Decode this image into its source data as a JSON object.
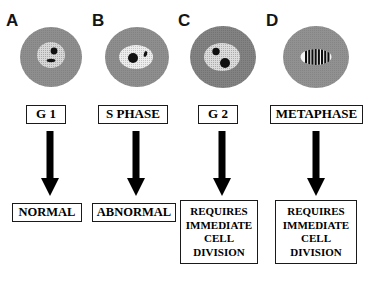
{
  "figure": {
    "background_color": "#ffffff",
    "ink_color": "#000000"
  },
  "colors": {
    "cytoplasm": "#8c8c8c",
    "cytoplasm_dark": "#7b7b7b",
    "nucleus_stipple_light": "#d8d8d8",
    "nucleus_white": "#f2f2f2",
    "chromatin": "#101010",
    "box_border": "#1a1a1a",
    "arrow": "#000000"
  },
  "columns": [
    {
      "letter": "A",
      "phase_label": "G 1",
      "outcome_lines": [
        "NORMAL"
      ],
      "cell": {
        "name": "cell-g1",
        "cytoplasm_fill": "#8c8c8c",
        "nucleus_fill": "#d8d8d8",
        "nucleus_style": "stippled",
        "bodies": [
          {
            "name": "chromatin-dot",
            "shape": "circle",
            "label": "round dark body"
          },
          {
            "name": "chromatin-dash",
            "shape": "ellipse",
            "label": "small dark dash"
          }
        ]
      }
    },
    {
      "letter": "B",
      "phase_label": "S PHASE",
      "outcome_lines": [
        "ABNORMAL"
      ],
      "cell": {
        "name": "cell-s-phase",
        "cytoplasm_fill": "#8c8c8c",
        "nucleus_fill": "#f2f2f2",
        "nucleus_style": "stippled-pale",
        "bodies": [
          {
            "name": "chromatin-dot-large",
            "shape": "circle",
            "label": "large dark body"
          },
          {
            "name": "chromatin-dash-small",
            "shape": "ellipse",
            "label": "small tilted dash"
          }
        ]
      }
    },
    {
      "letter": "C",
      "phase_label": "G 2",
      "outcome_lines": [
        "REQUIRES",
        "IMMEDIATE",
        "CELL",
        "DIVISION"
      ],
      "cell": {
        "name": "cell-g2",
        "cytoplasm_fill": "#7b7b7b",
        "nucleus_fill": "#d8d8d8",
        "nucleus_style": "stippled",
        "bodies": [
          {
            "name": "chromatin-dot-small",
            "shape": "circle",
            "label": "small dark body"
          },
          {
            "name": "chromatin-dot-large",
            "shape": "circle",
            "label": "large dark body"
          }
        ]
      }
    },
    {
      "letter": "D",
      "phase_label": "METAPHASE",
      "outcome_lines": [
        "REQUIRES",
        "IMMEDIATE",
        "CELL",
        "DIVISION"
      ],
      "cell": {
        "name": "cell-metaphase",
        "cytoplasm_fill": "#8c8c8c",
        "nucleus_fill": "#f2f2f2",
        "nucleus_style": "metaphase-plate",
        "chromosome_count": 8,
        "bodies": [
          {
            "name": "metaphase-plate",
            "shape": "barred-ellipse",
            "label": "aligned chromosomes"
          }
        ]
      }
    }
  ]
}
